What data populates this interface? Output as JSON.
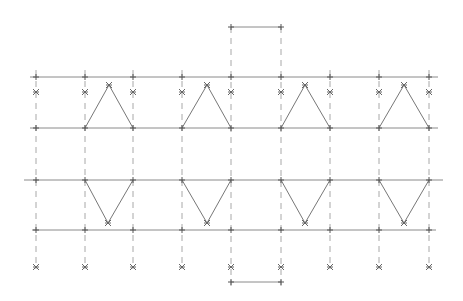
{
  "diagram": {
    "type": "truss-pattern",
    "colors": {
      "line": "#8a8a8a",
      "dash": "#a8a8a8",
      "marker": "#555555"
    },
    "columns_x": [
      36,
      85,
      133,
      182,
      231,
      281,
      330,
      379,
      429
    ],
    "top_bar": {
      "x1": 231,
      "x2": 281,
      "y": 27
    },
    "bottom_bar": {
      "x1": 231,
      "x2": 281,
      "y": 282
    },
    "horizontal_lines": [
      {
        "name": "upper-top-line",
        "x1": 30,
        "x2": 438,
        "y": 77
      },
      {
        "name": "upper-bottom-line",
        "x1": 30,
        "x2": 438,
        "y": 128
      },
      {
        "name": "middle-line",
        "x1": 24,
        "x2": 443,
        "y": 180
      },
      {
        "name": "lower-line",
        "x1": 32,
        "x2": 436,
        "y": 230
      }
    ],
    "upper_star_row_y": 92,
    "lower_star_row_y": 267,
    "upper_triangles": [
      {
        "left": 85,
        "apex": 109,
        "right": 133,
        "base_y": 128,
        "apex_y": 85
      },
      {
        "left": 182,
        "apex": 207,
        "right": 231,
        "base_y": 128,
        "apex_y": 85
      },
      {
        "left": 281,
        "apex": 305,
        "right": 330,
        "base_y": 128,
        "apex_y": 85
      },
      {
        "left": 379,
        "apex": 404,
        "right": 429,
        "base_y": 128,
        "apex_y": 85
      }
    ],
    "lower_triangles": [
      {
        "left": 85,
        "apex": 108,
        "right": 133,
        "base_y": 180,
        "apex_y": 223
      },
      {
        "left": 182,
        "apex": 207,
        "right": 231,
        "base_y": 180,
        "apex_y": 223
      },
      {
        "left": 281,
        "apex": 305,
        "right": 330,
        "base_y": 180,
        "apex_y": 223
      },
      {
        "left": 379,
        "apex": 404,
        "right": 429,
        "base_y": 180,
        "apex_y": 223
      }
    ]
  }
}
